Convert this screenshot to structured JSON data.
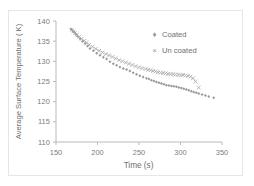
{
  "chart_data": {
    "type": "scatter",
    "title": "",
    "xlabel": "Time (s)",
    "ylabel": "Average Surface Temperature ( K)",
    "xlim": [
      150,
      350
    ],
    "ylim": [
      110,
      140
    ],
    "xticks": [
      150,
      200,
      250,
      300,
      350
    ],
    "yticks": [
      110,
      115,
      120,
      125,
      130,
      135,
      140
    ],
    "grid": false,
    "legend_position": "upper-right-inside",
    "series": [
      {
        "name": "Coated",
        "marker": "diamond",
        "color": "#9a9a9a",
        "x": [
          168,
          170,
          172,
          174,
          176,
          179,
          182,
          185,
          188,
          191,
          195,
          199,
          203,
          207,
          211,
          215,
          219,
          223,
          227,
          231,
          235,
          239,
          243,
          247,
          251,
          255,
          259,
          262,
          265,
          268,
          271,
          274,
          277,
          280,
          283,
          286,
          289,
          292,
          295,
          298,
          301,
          304,
          307,
          310,
          313,
          316,
          319,
          322,
          326,
          330,
          334,
          340
        ],
        "y": [
          138.0,
          137.6,
          137.2,
          136.7,
          136.2,
          135.6,
          135.0,
          134.4,
          133.8,
          133.2,
          132.6,
          132.0,
          131.5,
          131.0,
          130.6,
          129.9,
          129.4,
          129.0,
          128.6,
          128.2,
          128.0,
          127.6,
          127.2,
          126.8,
          126.4,
          126.1,
          125.8,
          125.6,
          125.3,
          125.1,
          124.9,
          124.7,
          124.5,
          124.3,
          124.1,
          124.0,
          123.9,
          123.8,
          123.7,
          123.5,
          123.4,
          123.2,
          123.0,
          122.8,
          122.6,
          122.4,
          122.2,
          122.0,
          121.8,
          121.5,
          121.3,
          121.0
        ]
      },
      {
        "name": "Un coated",
        "marker": "x",
        "color": "#b0b0b0",
        "x": [
          169,
          171,
          173,
          175,
          178,
          181,
          184,
          187,
          190,
          194,
          198,
          202,
          206,
          210,
          214,
          218,
          222,
          226,
          230,
          234,
          238,
          242,
          246,
          250,
          254,
          258,
          261,
          264,
          267,
          270,
          273,
          276,
          279,
          282,
          285,
          288,
          291,
          294,
          297,
          300,
          303,
          306,
          309,
          312,
          315,
          318,
          322
        ],
        "y": [
          137.8,
          137.4,
          137.0,
          136.6,
          136.1,
          135.6,
          135.1,
          134.6,
          134.1,
          133.6,
          133.1,
          132.6,
          132.2,
          131.8,
          131.5,
          131.1,
          130.7,
          130.3,
          130.0,
          129.7,
          129.4,
          129.1,
          128.8,
          128.5,
          128.3,
          128.1,
          127.9,
          127.8,
          127.6,
          127.5,
          127.3,
          127.2,
          127.1,
          127.0,
          126.9,
          126.8,
          126.8,
          126.7,
          126.7,
          126.6,
          126.6,
          126.5,
          126.4,
          126.2,
          125.8,
          125.0,
          123.5
        ]
      }
    ]
  },
  "legend": {
    "items": [
      {
        "label": "Coated",
        "glyph": "♦"
      },
      {
        "label": "Un coated",
        "glyph": "×"
      }
    ]
  },
  "axes": {
    "x_title": "Time (s)",
    "y_title": "Average Surface Temperature ( K)",
    "x_tick_labels": [
      "150",
      "200",
      "250",
      "300",
      "350"
    ],
    "y_tick_labels": [
      "140",
      "135",
      "130",
      "125",
      "120",
      "115",
      "110"
    ]
  },
  "colors": {
    "axis": "#b9b9b9",
    "tick_text": "#7b7b7b",
    "coated_marker": "#9a9a9a",
    "uncoated_marker": "#b0b0b0",
    "frame": "#e6e6e6"
  }
}
